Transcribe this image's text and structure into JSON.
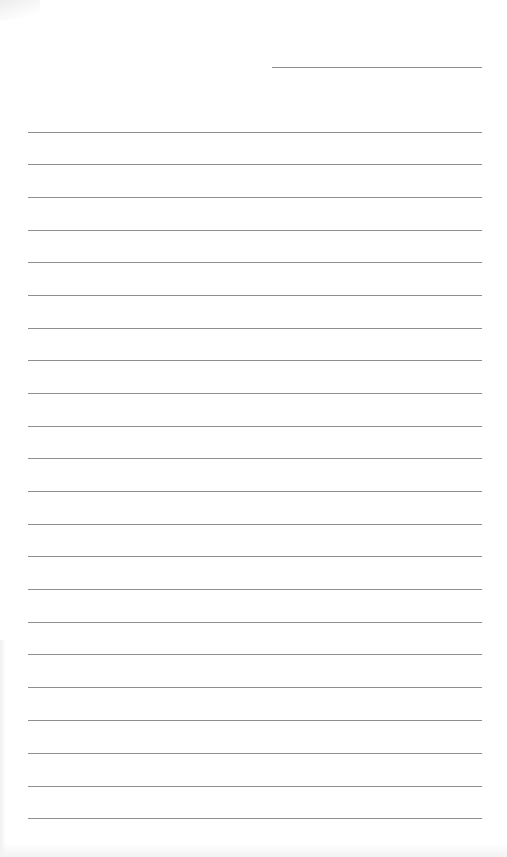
{
  "page": {
    "background": "#ffffff",
    "line_color": "#8e8e8e"
  },
  "header_line": {
    "x": 272,
    "y": 67,
    "width": 210
  },
  "ruled_lines": {
    "x": 28,
    "width": 454,
    "y": [
      132,
      164,
      197,
      230,
      262,
      295,
      328,
      360,
      393,
      426,
      458,
      491,
      524,
      556,
      589,
      622,
      654,
      687,
      720,
      753,
      786,
      818
    ]
  }
}
